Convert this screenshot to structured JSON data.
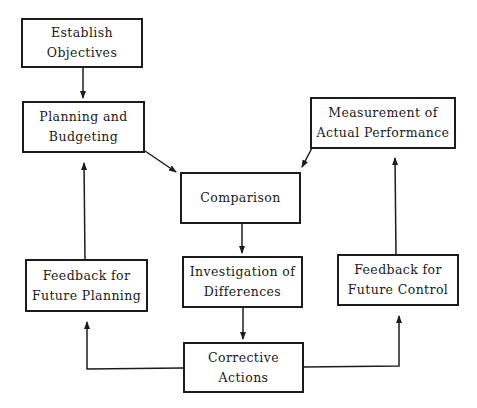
{
  "diagram": {
    "type": "flowchart",
    "title": "",
    "nodes": [
      {
        "id": "establish",
        "lines": [
          "Establish",
          "Objectives"
        ]
      },
      {
        "id": "planning",
        "lines": [
          "Planning and",
          "Budgeting"
        ]
      },
      {
        "id": "measurement",
        "lines": [
          "Measurement of",
          "Actual Performance"
        ]
      },
      {
        "id": "comparison",
        "lines": [
          "Comparison"
        ]
      },
      {
        "id": "feedback_planning",
        "lines": [
          "Feedback for",
          "Future Planning"
        ]
      },
      {
        "id": "investigation",
        "lines": [
          "Investigation of",
          "Differences"
        ]
      },
      {
        "id": "feedback_control",
        "lines": [
          "Feedback for",
          "Future Control"
        ]
      },
      {
        "id": "corrective",
        "lines": [
          "Corrective",
          "Actions"
        ]
      }
    ],
    "edges": [
      {
        "from": "establish",
        "to": "planning"
      },
      {
        "from": "planning",
        "to": "comparison"
      },
      {
        "from": "measurement",
        "to": "comparison"
      },
      {
        "from": "comparison",
        "to": "investigation"
      },
      {
        "from": "investigation",
        "to": "corrective"
      },
      {
        "from": "corrective",
        "to": "feedback_planning"
      },
      {
        "from": "corrective",
        "to": "feedback_control"
      },
      {
        "from": "feedback_planning",
        "to": "planning"
      },
      {
        "from": "feedback_control",
        "to": "measurement"
      }
    ],
    "colors": {
      "line": "#1c1c1c",
      "background": "#ffffff"
    }
  }
}
